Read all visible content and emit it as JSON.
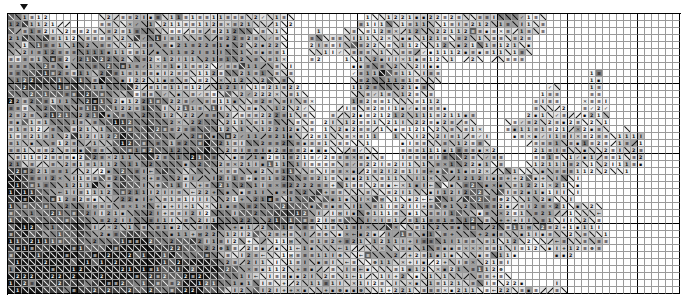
{
  "chart_data": {
    "type": "heatmap",
    "subtitle": "Monochrome symbol chart, grayscale floss shading",
    "xlabel": "",
    "ylabel": "",
    "grid": true,
    "legend_position": "none",
    "columns": 96,
    "rows": 40,
    "cell_px": 7,
    "block_size": 10,
    "axis_note": "Heavy rules every 10 stitches; no printed tick numbers",
    "palette": {
      "f0": "#ffffff",
      "f1": "#f2f2f2",
      "f2": "#e2e2e2",
      "f3": "#cfcfcf",
      "f4": "#b8b8b8",
      "f5": "#a0a0a0",
      "f6": "#828282",
      "f7": "#5e5e5e",
      "f8": "#3a3a3a",
      "f9": "#141414"
    },
    "symbols": [
      {
        "key": "blank",
        "glyph": "",
        "name": "empty-stitch"
      },
      {
        "key": "slash",
        "glyph": "\\",
        "name": "backslash-stitch"
      },
      {
        "key": "rslash",
        "glyph": "/",
        "name": "forwardslash-stitch"
      },
      {
        "key": "eq",
        "glyph": "≡",
        "name": "triple-bar-stitch"
      },
      {
        "key": "one",
        "glyph": "1",
        "name": "digit-one-stitch"
      },
      {
        "key": "two",
        "glyph": "2",
        "name": "digit-two-stitch"
      },
      {
        "key": "ibar",
        "glyph": "I",
        "name": "i-bar-stitch"
      },
      {
        "key": "dot",
        "glyph": "▪",
        "name": "square-dot-stitch"
      },
      {
        "key": "plus",
        "glyph": "+",
        "name": "plus-stitch"
      },
      {
        "key": "cross",
        "glyph": "✕",
        "name": "cross-stitch"
      },
      {
        "key": "arrow",
        "glyph": "←",
        "name": "left-arrow-stitch"
      },
      {
        "key": "grid",
        "glyph": "⊞",
        "name": "boxed-plus-stitch"
      },
      {
        "key": "circ",
        "glyph": "⊕",
        "name": "circled-plus-stitch"
      },
      {
        "key": "tick",
        "glyph": "✓",
        "name": "check-stitch"
      },
      {
        "key": "colon",
        "glyph": ":",
        "name": "colon-stitch"
      }
    ],
    "center_marker": {
      "glyph": "▼",
      "name": "top-center-marker",
      "column": 2
    }
  },
  "chart": {
    "center_marker_label": ""
  }
}
